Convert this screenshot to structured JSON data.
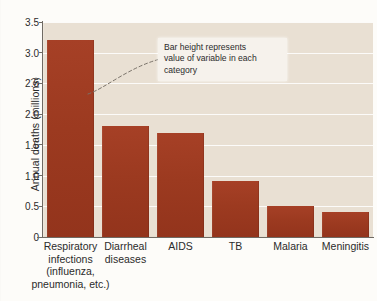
{
  "chart_data": {
    "type": "bar",
    "title": "",
    "xlabel": "",
    "ylabel": "Annual deaths (millions)",
    "ylim": [
      0,
      3.5
    ],
    "grid": true,
    "legend": "none",
    "categories": [
      "Respiratory infections (influenza, pneumonia, etc.)",
      "Diarrheal diseases",
      "AIDS",
      "TB",
      "Malaria",
      "Meningitis"
    ],
    "category_lines": [
      [
        "Respiratory",
        "infections",
        "(influenza,",
        "pneumonia, etc.)"
      ],
      [
        "Diarrheal",
        "diseases"
      ],
      [
        "AIDS"
      ],
      [
        "TB"
      ],
      [
        "Malaria"
      ],
      [
        "Meningitis"
      ]
    ],
    "values": [
      3.2,
      1.8,
      1.7,
      0.92,
      0.5,
      0.4
    ],
    "y_ticks": [
      "3.5",
      "3.0",
      "2.5",
      "2.0",
      "1.5",
      "1.0",
      "0.5",
      "0"
    ],
    "y_tick_values": [
      3.5,
      3.0,
      2.5,
      2.0,
      1.5,
      1.0,
      0.5,
      0
    ],
    "colors": {
      "bar": "#9c3a20",
      "plot_background": "#e9e0d3",
      "page_background": "#fdfcf9",
      "gridline": "#ffffff",
      "axis": "#6f6a63",
      "text": "#2b2b2b",
      "annotation_background": "#f6f2ec"
    }
  },
  "annotation": {
    "lines": [
      "Bar height represents",
      "value of variable in each",
      "category"
    ]
  }
}
